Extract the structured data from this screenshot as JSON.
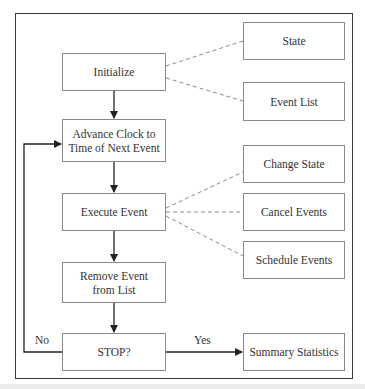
{
  "diagram": {
    "title": "",
    "main_flow": [
      {
        "id": "initialize",
        "label": "Initialize"
      },
      {
        "id": "advance-clock",
        "label": "Advance Clock to Time of Next Event",
        "line1": "Advance Clock to",
        "line2": "Time of Next Event"
      },
      {
        "id": "execute-event",
        "label": "Execute Event"
      },
      {
        "id": "remove-event",
        "label": "Remove Event from List",
        "line1": "Remove Event",
        "line2": "from List"
      },
      {
        "id": "stop",
        "label": "STOP?"
      }
    ],
    "side_boxes": [
      {
        "id": "state",
        "label": "State",
        "linked_to": "initialize"
      },
      {
        "id": "event-list",
        "label": "Event List",
        "linked_to": "initialize"
      },
      {
        "id": "change-state",
        "label": "Change State",
        "linked_to": "execute-event"
      },
      {
        "id": "cancel-events",
        "label": "Cancel Events",
        "linked_to": "execute-event"
      },
      {
        "id": "schedule-events",
        "label": "Schedule Events",
        "linked_to": "execute-event"
      },
      {
        "id": "summary-statistics",
        "label": "Summary Statistics",
        "linked_to": "stop"
      }
    ],
    "edge_labels": {
      "no": "No",
      "yes": "Yes"
    },
    "colors": {
      "frame": "#3a3a3a",
      "box_border": "#8a8a8a",
      "arrow": "#222222",
      "dashed": "#8a8a8a",
      "text": "#333333"
    }
  }
}
